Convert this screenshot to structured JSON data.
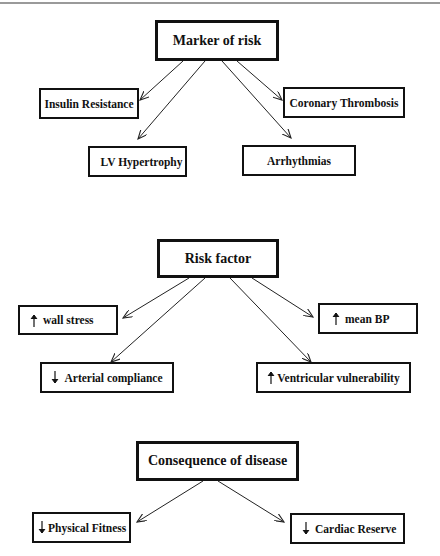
{
  "diagram": {
    "sections": [
      {
        "id": "marker",
        "title": "Marker of risk",
        "children": [
          {
            "label": "Insulin Resistance",
            "indicator": ""
          },
          {
            "label": "LV Hypertrophy",
            "indicator": ""
          },
          {
            "label": "Coronary Thrombosis",
            "indicator": ""
          },
          {
            "label": "Arrhythmias",
            "indicator": ""
          }
        ]
      },
      {
        "id": "risk",
        "title": "Risk factor",
        "children": [
          {
            "label": "wall stress",
            "indicator": "up-arrow"
          },
          {
            "label": "Arterial compliance",
            "indicator": "down-arrow"
          },
          {
            "label": "mean BP",
            "indicator": "up-arrow"
          },
          {
            "label": "Ventricular vulnerability",
            "indicator": "up-arrow"
          }
        ]
      },
      {
        "id": "consequence",
        "title": "Consequence of disease",
        "children": [
          {
            "label": "Physical Fitness",
            "indicator": "down-arrow"
          },
          {
            "label": "Cardiac Reserve",
            "indicator": "down-arrow"
          }
        ]
      }
    ],
    "colors": {
      "line": "#111111",
      "topline": "#9a9a9a",
      "background": "#ffffff"
    }
  }
}
